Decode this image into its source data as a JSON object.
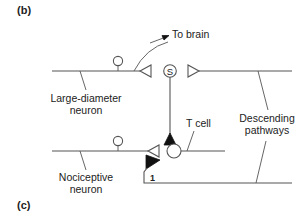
{
  "figure": {
    "panels": [
      {
        "label": "(b)"
      },
      {
        "label": "(c)"
      }
    ],
    "labels": {
      "to_brain": "To brain",
      "large_neuron_line1": "Large-diameter",
      "large_neuron_line2": "neuron",
      "t_cell": "T cell",
      "descending_line1": "Descending",
      "descending_line2": "pathways",
      "nociceptive_line1": "Nociceptive",
      "nociceptive_line2": "neuron",
      "s_cell": "S",
      "synapse_number": "1"
    },
    "colors": {
      "line": "#555555",
      "inhibitory_fill": "#111111",
      "text": "#222222"
    }
  }
}
